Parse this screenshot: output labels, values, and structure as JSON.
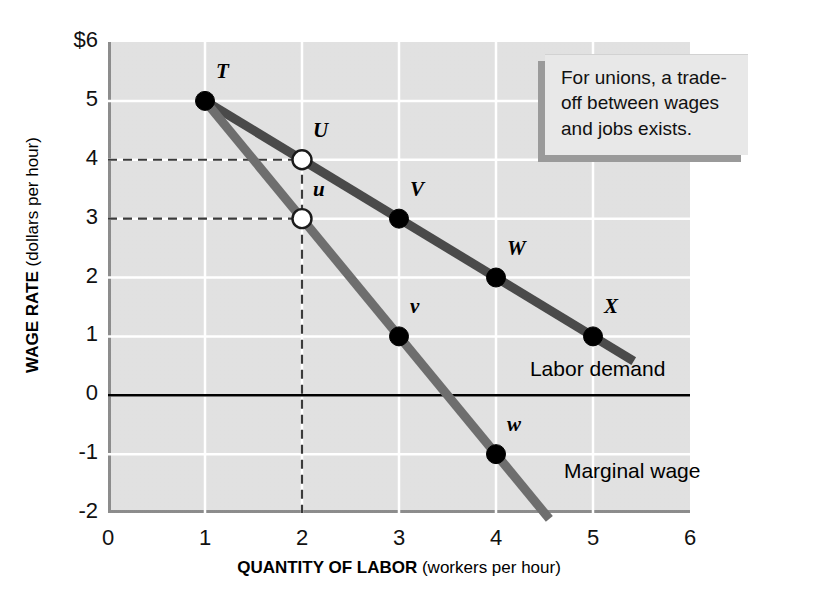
{
  "figure": {
    "callout": "For unions, a trade-off between wages and jobs exists."
  },
  "chart_data": {
    "type": "line",
    "title": "",
    "xlabel_bold": "QUANTITY OF LABOR",
    "xlabel_plain": " (workers per hour)",
    "ylabel_bold": "WAGE RATE",
    "ylabel_plain": " (dollars per hour)",
    "xlim": [
      0,
      6
    ],
    "ylim": [
      -2,
      6
    ],
    "xticks": [
      "0",
      "1",
      "2",
      "3",
      "4",
      "5",
      "6"
    ],
    "yticks": [
      "$6",
      "5",
      "4",
      "3",
      "2",
      "1",
      "0",
      "-1",
      "-2"
    ],
    "grid": true,
    "legend_position": "inline-annotation",
    "series": [
      {
        "name": "Labor demand",
        "label": "Labor demand",
        "color": "#4a4a4a",
        "x": [
          1,
          2,
          3,
          4,
          5
        ],
        "y": [
          5,
          4,
          3,
          2,
          1
        ],
        "line_from": [
          1,
          5
        ],
        "line_to": [
          5.42,
          0.58
        ],
        "points": [
          {
            "label": "T",
            "x": 1,
            "y": 5,
            "filled": true
          },
          {
            "label": "U",
            "x": 2,
            "y": 4,
            "filled": false
          },
          {
            "label": "V",
            "x": 3,
            "y": 3,
            "filled": true
          },
          {
            "label": "W",
            "x": 4,
            "y": 2,
            "filled": true
          },
          {
            "label": "X",
            "x": 5,
            "y": 1,
            "filled": true
          }
        ]
      },
      {
        "name": "Marginal wage",
        "label": "Marginal wage",
        "color": "#6e6e6e",
        "x": [
          1,
          2,
          3,
          4
        ],
        "y": [
          5,
          3,
          1,
          -1
        ],
        "line_from": [
          1,
          5
        ],
        "line_to": [
          4.55,
          -2.1
        ],
        "points": [
          {
            "label": "u",
            "x": 2,
            "y": 3,
            "filled": false
          },
          {
            "label": "v",
            "x": 3,
            "y": 1,
            "filled": true
          },
          {
            "label": "w",
            "x": 4,
            "y": -1,
            "filled": true
          }
        ]
      }
    ],
    "zero_line": {
      "y": 0,
      "color": "#000000"
    },
    "guides": [
      {
        "type": "horizontal",
        "y": 4,
        "from_x": 0,
        "to_x": 2
      },
      {
        "type": "horizontal",
        "y": 3,
        "from_x": 0,
        "to_x": 2
      },
      {
        "type": "vertical",
        "x": 2,
        "from_y": 4,
        "to_y": -2
      }
    ],
    "annotations": [
      {
        "text": "Labor demand",
        "x": 4.35,
        "y": 0.42
      },
      {
        "text": "Marginal wage",
        "x": 4.7,
        "y": -1.32
      }
    ]
  }
}
